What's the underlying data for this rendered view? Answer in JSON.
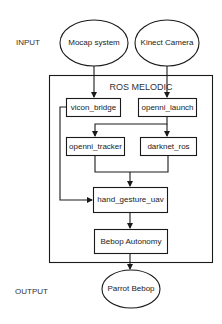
{
  "diagram": {
    "side_labels": {
      "input": "INPUT",
      "output": "OUTPUT"
    },
    "container": {
      "title": "ROS MELODIC"
    },
    "nodes": {
      "mocap": {
        "label": "Mocap system",
        "shape": "ellipse"
      },
      "kinect": {
        "label": "Kinect Camera",
        "shape": "ellipse"
      },
      "vicon_bridge": {
        "label": "vicon_bridge",
        "shape": "rect"
      },
      "openni_launch": {
        "label": "openni_launch",
        "shape": "rect"
      },
      "openni_tracker": {
        "label": "openni_tracker",
        "shape": "rect"
      },
      "darknet_ros": {
        "label": "darknet_ros",
        "shape": "rect"
      },
      "hand_gesture_uav": {
        "label": "hand_gesture_uav",
        "shape": "rect"
      },
      "bebop_autonomy": {
        "label": "Bebop Autonomy",
        "shape": "rect"
      },
      "parrot_bebop": {
        "label": "Parrot Bebop",
        "shape": "ellipse"
      }
    },
    "edges": [
      {
        "from": "Mocap system",
        "to": "vicon_bridge"
      },
      {
        "from": "Kinect Camera",
        "to": "openni_launch"
      },
      {
        "from": "openni_launch",
        "to": "openni_tracker"
      },
      {
        "from": "openni_launch",
        "to": "darknet_ros"
      },
      {
        "from": "openni_tracker",
        "to": "hand_gesture_uav"
      },
      {
        "from": "darknet_ros",
        "to": "hand_gesture_uav"
      },
      {
        "from": "vicon_bridge",
        "to": "hand_gesture_uav"
      },
      {
        "from": "hand_gesture_uav",
        "to": "Bebop Autonomy"
      },
      {
        "from": "Bebop Autonomy",
        "to": "Parrot Bebop"
      }
    ],
    "colors": {
      "stroke": "#1a1a1a",
      "fill": "#ffffff",
      "text": "#222222"
    }
  }
}
